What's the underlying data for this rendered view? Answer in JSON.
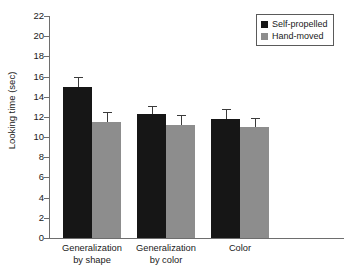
{
  "chart_data": {
    "type": "bar",
    "title": "",
    "xlabel": "",
    "ylabel": "Looking time (sec)",
    "ylim": [
      0,
      22
    ],
    "ytick_step": 2,
    "yticks": [
      0,
      2,
      4,
      6,
      8,
      10,
      12,
      14,
      16,
      18,
      20,
      22
    ],
    "ytick_labels": [
      "0",
      "2",
      "4",
      "6",
      "8",
      "10",
      "12",
      "14",
      "16",
      "18",
      "20",
      "22"
    ],
    "grid": false,
    "legend_position": "top-right",
    "categories": [
      "Generalization\nby shape",
      "Generalization\nby color",
      "Color"
    ],
    "series": [
      {
        "name": "Self-propelled",
        "color": "#161616",
        "values": [
          15.0,
          12.3,
          11.8
        ],
        "errors": [
          1.0,
          0.8,
          1.0
        ]
      },
      {
        "name": "Hand-moved",
        "color": "#8d8d8d",
        "values": [
          11.5,
          11.2,
          11.0
        ],
        "errors": [
          1.0,
          1.0,
          0.9
        ]
      }
    ]
  },
  "legend": {
    "items": [
      {
        "label": "Self-propelled",
        "swatch": "black-square"
      },
      {
        "label": "Hand-moved",
        "swatch": "gray-square"
      }
    ]
  },
  "axes": {
    "y_title": "Looking time (sec)"
  }
}
